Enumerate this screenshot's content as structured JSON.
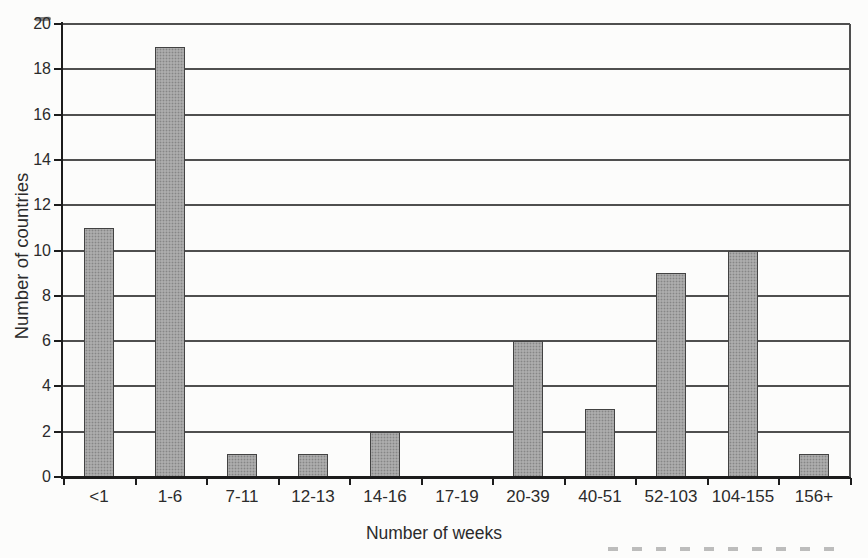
{
  "chart_data": {
    "type": "bar",
    "title": "",
    "xlabel": "Number of weeks",
    "ylabel": "Number of countries",
    "categories": [
      "<1",
      "1-6",
      "7-11",
      "12-13",
      "14-16",
      "17-19",
      "20-39",
      "40-51",
      "52-103",
      "104-155",
      "156+"
    ],
    "values": [
      11,
      19,
      1,
      1,
      2,
      0,
      6,
      3,
      9,
      10,
      1
    ],
    "ylim": [
      0,
      20
    ],
    "ytick_step": 2,
    "yticks": [
      0,
      2,
      4,
      6,
      8,
      10,
      12,
      14,
      16,
      18,
      20
    ],
    "grid": "horizontal gridlines at every y tick",
    "legend": "none",
    "colors": {
      "bar_fill": "#acacac",
      "bar_dot": "#868686",
      "bar_border": "#424242",
      "axis": "#1c1c1c",
      "gridline": "#4f4f4f",
      "text": "#2b2b2b",
      "background": "#fcfcfb"
    }
  }
}
